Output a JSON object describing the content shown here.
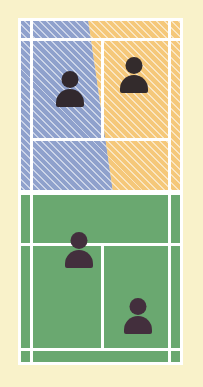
{
  "diagram": {
    "type": "sports-court-overhead",
    "surface": {
      "surround_color": "#f9f2ca",
      "near_half_color": "#6aa870",
      "line_color": "#ffffff",
      "net_label": "net"
    },
    "zones": [
      {
        "id": "zone-left",
        "label": "Left player coverage zone",
        "color": "#8fa1cc",
        "pattern": "diagonal-hatch",
        "side": "far-left"
      },
      {
        "id": "zone-right",
        "label": "Right player coverage zone",
        "color": "#f5c87a",
        "pattern": "diagonal-hatch",
        "side": "far-right"
      }
    ],
    "players": [
      {
        "id": "player-far-left",
        "label": "Far court left player",
        "half": "far",
        "zone": "zone-left",
        "x": 70,
        "y": 71
      },
      {
        "id": "player-far-right",
        "label": "Far court right player",
        "half": "far",
        "zone": "zone-right",
        "x": 134,
        "y": 57
      },
      {
        "id": "player-near-left",
        "label": "Near court left player",
        "half": "near",
        "zone": "none",
        "x": 79,
        "y": 232
      },
      {
        "id": "player-near-right",
        "label": "Near court right player",
        "half": "near",
        "zone": "none",
        "x": 138,
        "y": 298
      }
    ],
    "lines": {
      "far_baseline": "far baseline",
      "far_service_line": "far service line",
      "far_center_service_line": "far center service line",
      "near_service_line": "near service line",
      "near_baseline": "near baseline",
      "near_center_service_line": "near center service line",
      "left_doubles_sideline": "left doubles sideline",
      "left_singles_sideline": "left singles sideline",
      "right_singles_sideline": "right singles sideline",
      "right_doubles_sideline": "right doubles sideline"
    }
  }
}
